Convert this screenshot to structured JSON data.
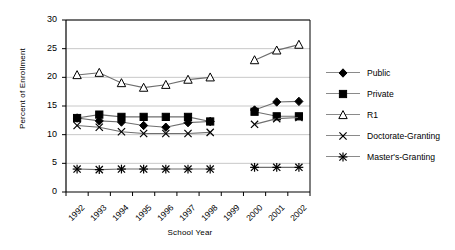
{
  "chart_data": {
    "type": "line",
    "title": "",
    "xlabel": "School Year",
    "ylabel": "Percent of Enrollment",
    "categories": [
      "1992",
      "1993",
      "1994",
      "1995",
      "1996",
      "1997",
      "1998",
      "1999",
      "2000",
      "2001",
      "2002"
    ],
    "ylim": [
      0,
      30
    ],
    "yticks": [
      0,
      5,
      10,
      15,
      20,
      25,
      30
    ],
    "grid": "horizontal",
    "legend_position": "right",
    "series": [
      {
        "name": "Public",
        "marker": "filled-diamond",
        "values": [
          12.9,
          12.4,
          12.2,
          11.6,
          11.3,
          12.1,
          12.3,
          null,
          14.3,
          15.7,
          15.8
        ]
      },
      {
        "name": "Private",
        "marker": "filled-square",
        "values": [
          12.9,
          13.5,
          13.1,
          13.1,
          13.1,
          13.1,
          12.3,
          null,
          14.0,
          13.2,
          13.2
        ]
      },
      {
        "name": "R1",
        "marker": "open-triangle",
        "values": [
          20.4,
          20.8,
          19.0,
          18.2,
          18.7,
          19.6,
          20.0,
          null,
          23.0,
          24.7,
          25.7
        ]
      },
      {
        "name": "Doctorate-Granting",
        "marker": "cross-x",
        "values": [
          11.6,
          11.3,
          10.5,
          10.2,
          10.2,
          10.2,
          10.4,
          null,
          11.8,
          12.8,
          13.0
        ]
      },
      {
        "name": "Master's-Granting",
        "marker": "asterisk",
        "values": [
          4.0,
          3.9,
          4.0,
          4.0,
          4.0,
          4.0,
          4.0,
          null,
          4.3,
          4.3,
          4.3
        ]
      }
    ]
  },
  "colors": {
    "line": "#6f6f6f",
    "marker": "#000000",
    "grid": "#c8c8c8",
    "axis": "#000000",
    "background": "#ffffff"
  },
  "legend": [
    {
      "label": "Public"
    },
    {
      "label": "Private"
    },
    {
      "label": "R1"
    },
    {
      "label": "Doctorate-Granting"
    },
    {
      "label": "Master's-Granting"
    }
  ]
}
